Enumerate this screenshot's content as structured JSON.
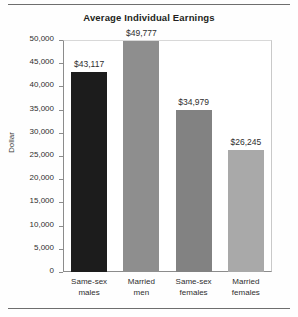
{
  "chart_data": {
    "type": "bar",
    "title": "Average Individual Earnings",
    "xlabel": "",
    "ylabel": "Dollar",
    "categories": [
      "Same-sex males",
      "Married men",
      "Same-sex females",
      "Married females"
    ],
    "category_lines": [
      [
        "Same-sex",
        "males"
      ],
      [
        "Married",
        "men"
      ],
      [
        "Same-sex",
        "females"
      ],
      [
        "Married",
        "females"
      ]
    ],
    "values": [
      43117,
      49777,
      34979,
      26245
    ],
    "value_labels": [
      "$43,117",
      "$49,777",
      "$34,979",
      "$26,245"
    ],
    "bar_colors": [
      "#1c1c1c",
      "#8e8e8e",
      "#828282",
      "#a9a9a9"
    ],
    "ylim": [
      0,
      50000
    ],
    "ytick_values": [
      0,
      5000,
      10000,
      15000,
      20000,
      25000,
      30000,
      35000,
      40000,
      45000,
      50000
    ],
    "ytick_labels": [
      "0",
      "5,000",
      "10,000",
      "15,000",
      "20,000",
      "25,000",
      "30,000",
      "35,000",
      "40,000",
      "45,000",
      "50,000"
    ],
    "grid": false,
    "legend": null
  }
}
